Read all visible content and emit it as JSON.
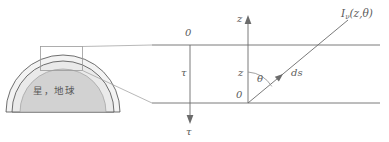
{
  "figure": {
    "kind": "plane-parallel-atmosphere-diagram",
    "colors": {
      "line": "#6b6b6b",
      "arc": "#4d4d4d",
      "dome_fill": "#d2d2d2",
      "shell_fill": "#ededed",
      "box_stroke": "#9a9a9a",
      "text": "#5a5a5a"
    }
  },
  "left_panel": {
    "name": "planet-dome",
    "body_label": "星，地球",
    "zoom_box": {
      "label": ""
    },
    "layers": [
      {
        "name": "outer-atmosphere-arc"
      },
      {
        "name": "inner-atmosphere-arc"
      },
      {
        "name": "planet-surface-dome"
      }
    ]
  },
  "right_panel": {
    "name": "slab-geometry",
    "top_boundary": {
      "label": "0",
      "axis": "tau"
    },
    "bottom_origin": {
      "label": "0",
      "axis": "z"
    },
    "tau_axis": {
      "mid_label": "τ",
      "end_label": "τ"
    },
    "z_axis": {
      "tip_label": "z",
      "mid_label": "z"
    },
    "angle": {
      "label": "θ"
    },
    "path_element": {
      "label": "ds"
    },
    "intensity": {
      "symbol": "I",
      "subscript": "ν",
      "args": "(z,θ)"
    }
  }
}
